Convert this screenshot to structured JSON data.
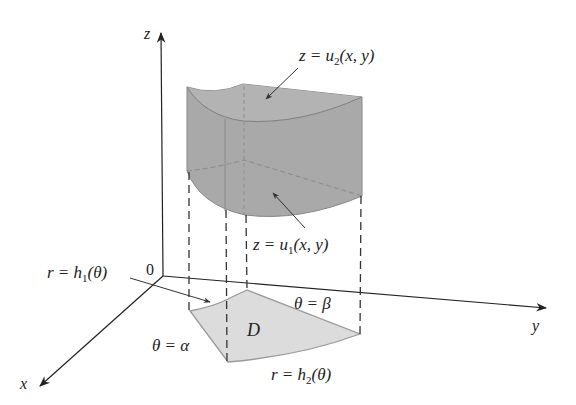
{
  "figure": {
    "colors": {
      "solid_fill": "#a8a8a8",
      "solid_top_fill": "#b4b4b4",
      "region_fill": "#dcdcdc",
      "edge": "#7a7a7a",
      "axis": "#222222"
    },
    "axes": {
      "z_label": "z",
      "y_label": "y",
      "x_label": "x",
      "origin_label": "0"
    },
    "labels": {
      "upper_surface": {
        "lhs": "z = u",
        "sub": "2",
        "rhs": "(x, y)"
      },
      "lower_surface": {
        "lhs": "z = u",
        "sub": "1",
        "rhs": "(x, y)"
      },
      "inner_curve": {
        "lhs": "r = h",
        "sub": "1",
        "rhs": "(θ)"
      },
      "outer_curve": {
        "lhs": "r = h",
        "sub": "2",
        "rhs": "(θ)"
      },
      "theta_alpha": "θ = α",
      "theta_beta": "θ = β",
      "region": "D"
    }
  }
}
